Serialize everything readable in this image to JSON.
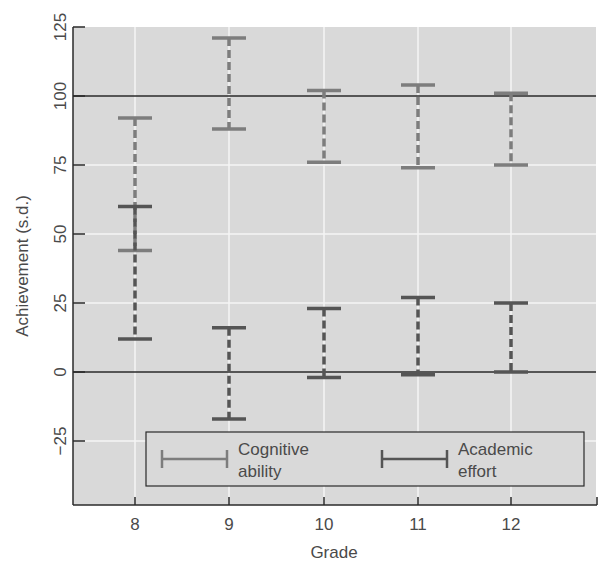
{
  "chart_data": {
    "type": "errorbar",
    "title": "",
    "xlabel": "Grade",
    "ylabel": "Achievement (s.d.)",
    "categories": [
      "8",
      "9",
      "10",
      "11",
      "12"
    ],
    "ylim": [
      -50,
      125
    ],
    "yticks": [
      125,
      100,
      75,
      50,
      25,
      0,
      -25
    ],
    "ytick_labels": [
      "125",
      "100",
      "75",
      "50",
      "25",
      "0",
      "−25"
    ],
    "reference_lines": [
      0,
      100
    ],
    "grid": true,
    "legend_position": "bottom-inside",
    "series": [
      {
        "name": "Cognitive ability",
        "color": "#7d7d7d",
        "ranges": [
          {
            "grade": "8",
            "low": 44,
            "high": 92
          },
          {
            "grade": "9",
            "low": 88,
            "high": 121
          },
          {
            "grade": "10",
            "low": 76,
            "high": 102
          },
          {
            "grade": "11",
            "low": 74,
            "high": 104
          },
          {
            "grade": "12",
            "low": 75,
            "high": 101
          }
        ]
      },
      {
        "name": "Academic effort",
        "color": "#555555",
        "ranges": [
          {
            "grade": "8",
            "low": 12,
            "high": 60
          },
          {
            "grade": "9",
            "low": -17,
            "high": 16
          },
          {
            "grade": "10",
            "low": -2,
            "high": 23
          },
          {
            "grade": "11",
            "low": -1,
            "high": 27
          },
          {
            "grade": "12",
            "low": 0,
            "high": 25
          }
        ]
      }
    ]
  },
  "legend": {
    "cognitive_line1": "Cognitive",
    "cognitive_line2": "ability",
    "effort_line1": "Academic",
    "effort_line2": "effort"
  },
  "axes": {
    "xlabel": "Grade",
    "ylabel": "Achievement (s.d.)"
  }
}
